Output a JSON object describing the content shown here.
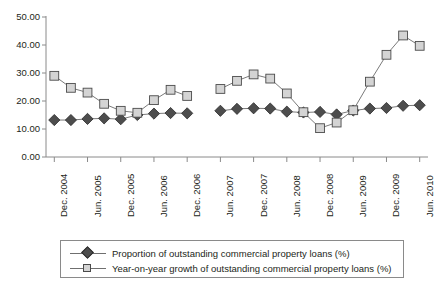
{
  "chart_data": {
    "type": "line",
    "title": "",
    "subtitle": "",
    "xlabel": "",
    "ylabel": "",
    "ylim": [
      0,
      50
    ],
    "ytick_labels": [
      "0.00",
      "10.00",
      "20.00",
      "30.00",
      "40.00",
      "50.00"
    ],
    "ytick_values": [
      0,
      10,
      20,
      30,
      40,
      50
    ],
    "grid": false,
    "legend_position": "bottom",
    "x_tick_labels": [
      "Dec. 2004",
      "Jun. 2005",
      "Dec. 2005",
      "Jun. 2006",
      "Dec. 2006",
      "Jun. 2007",
      "Dec. 2007",
      "Jun. 2008",
      "Dec. 2008",
      "Jun. 2009",
      "Dec. 2009",
      "Jun. 2010"
    ],
    "x_tick_indices": [
      0,
      2,
      4,
      6,
      8,
      10,
      12,
      14,
      16,
      18,
      20,
      22
    ],
    "x": [
      "Dec. 2004",
      "Mar. 2005",
      "Jun. 2005",
      "Sep. 2005",
      "Dec. 2005",
      "Mar. 2006",
      "Jun. 2006",
      "Sep. 2006",
      "Dec. 2006",
      "Mar. 2007",
      "Jun. 2007",
      "Sep. 2007",
      "Dec. 2007",
      "Mar. 2008",
      "Jun. 2008",
      "Sep. 2008",
      "Dec. 2008",
      "Mar. 2009",
      "Jun. 2009",
      "Sep. 2009",
      "Dec. 2009",
      "Mar. 2010",
      "Jun. 2010"
    ],
    "series": [
      {
        "name": "Proportion of outstanding commercial property loans (%)",
        "marker": "diamond",
        "color": "#4d4d4d",
        "values": [
          13.2,
          13.2,
          13.6,
          13.8,
          13.5,
          15.0,
          15.5,
          15.7,
          15.6,
          null,
          16.5,
          17.2,
          17.4,
          17.3,
          16.2,
          15.9,
          16.1,
          15.2,
          16.6,
          17.3,
          17.5,
          18.3,
          18.5
        ]
      },
      {
        "name": "Year-on-year growth of outstanding commercial property loans (%)",
        "marker": "square",
        "color": "#d4d4d4",
        "values": [
          29.0,
          24.7,
          23.0,
          19.0,
          16.5,
          15.8,
          20.3,
          24.0,
          21.8,
          null,
          24.3,
          27.2,
          29.5,
          28.0,
          22.7,
          16.0,
          10.3,
          12.3,
          16.7,
          26.9,
          36.5,
          43.4,
          39.7
        ]
      }
    ],
    "legend": [
      "Proportion of outstanding commercial property loans (%)",
      "Year-on-year growth of outstanding commercial property loans (%)"
    ]
  }
}
